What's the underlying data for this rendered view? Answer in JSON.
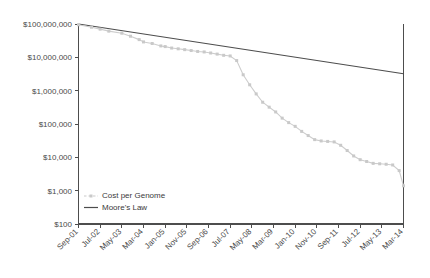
{
  "chart_data": {
    "type": "line",
    "title": "",
    "subtitle": "",
    "xlabel": "",
    "ylabel": "",
    "y_scale": "log",
    "ylim": [
      100,
      100000000
    ],
    "grid": false,
    "legend_position": "bottom-left-inside",
    "y_ticks": [
      "$100,000,000",
      "$10,000,000",
      "$1,000,000",
      "$100,000",
      "$10,000",
      "$1,000",
      "$100"
    ],
    "y_tick_values": [
      100000000,
      10000000,
      1000000,
      100000,
      10000,
      1000,
      100
    ],
    "x_ticks": [
      "Sep-01",
      "Jul-02",
      "May-03",
      "Mar-04",
      "Jan-05",
      "Nov-05",
      "Sep-06",
      "Jul-07",
      "May-08",
      "Mar-09",
      "Jan-10",
      "Nov-10",
      "Sep-11",
      "Jul-12",
      "May-13",
      "Mar-14"
    ],
    "legend": [
      {
        "name": "Cost per Genome",
        "color": "#c9c9c9",
        "style": "line-with-markers"
      },
      {
        "name": "Moore's Law",
        "color": "#4d4d4d",
        "style": "solid-line"
      }
    ],
    "series": [
      {
        "name": "Cost per Genome",
        "color": "#c9c9c9",
        "x": [
          "Sep-01",
          "Mar-02",
          "Jul-02",
          "Nov-02",
          "May-03",
          "Sep-03",
          "Jan-04",
          "Mar-04",
          "Jul-04",
          "Nov-04",
          "Jan-05",
          "Apr-05",
          "Jul-05",
          "Oct-05",
          "Jan-06",
          "Apr-06",
          "Jul-06",
          "Oct-06",
          "Jan-07",
          "Apr-07",
          "Jul-07",
          "Oct-07",
          "Jan-08",
          "Apr-08",
          "Jul-08",
          "Oct-08",
          "Jan-09",
          "Apr-09",
          "Jul-09",
          "Oct-09",
          "Jan-10",
          "Apr-10",
          "Jul-10",
          "Oct-10",
          "Jan-11",
          "Apr-11",
          "Jul-11",
          "Oct-11",
          "Jan-12",
          "Apr-12",
          "Jul-12",
          "Oct-12",
          "Jan-13",
          "Apr-13",
          "Jul-13",
          "Oct-13",
          "Jan-14",
          "Mar-14"
        ],
        "values": [
          95000000,
          80000000,
          70000000,
          61000000,
          53000000,
          43000000,
          34000000,
          29000000,
          26000000,
          22000000,
          21000000,
          19000000,
          18000000,
          17000000,
          16000000,
          15000000,
          14500000,
          13500000,
          12500000,
          11500000,
          11000000,
          8000000,
          3000000,
          1500000,
          800000,
          450000,
          320000,
          230000,
          150000,
          110000,
          85000,
          60000,
          45000,
          34000,
          31000,
          30000,
          29000,
          23000,
          16000,
          11000,
          8500,
          7500,
          6600,
          6400,
          6200,
          5900,
          4000,
          1400
        ]
      },
      {
        "name": "Moore's Law",
        "color": "#4d4d4d",
        "x": [
          "Sep-01",
          "Mar-14"
        ],
        "values": [
          100000000,
          3200000
        ],
        "note": "halving every 24 months"
      }
    ]
  }
}
